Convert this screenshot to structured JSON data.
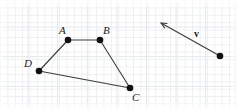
{
  "figure": {
    "width": 237,
    "height": 110,
    "background_color": "#ffffff",
    "grid": {
      "visible": true,
      "minor_color": "#eceff1",
      "major_color": "#e2e6ea",
      "minor_spacing_px": 7.4,
      "major_spacing_px": 29.6
    },
    "stroke_color": "#3b3b3b",
    "point_color": "#111111",
    "label_color": "#1a1a1a"
  },
  "polygon": {
    "name": "ABCD",
    "closed": true,
    "stroke_width": 1.1,
    "vertices": [
      {
        "id": "A",
        "label": "A",
        "x": 68,
        "y": 40,
        "label_x": 59,
        "label_y": 25,
        "radius": 3.3
      },
      {
        "id": "B",
        "label": "B",
        "x": 100,
        "y": 40,
        "label_x": 103,
        "label_y": 25,
        "radius": 3.3
      },
      {
        "id": "C",
        "label": "C",
        "x": 130,
        "y": 88,
        "label_x": 132,
        "label_y": 92,
        "radius": 3.3
      },
      {
        "id": "D",
        "label": "D",
        "x": 39,
        "y": 71,
        "label_x": 24,
        "label_y": 58,
        "radius": 3.3
      }
    ],
    "edges": [
      {
        "from": "A",
        "to": "B"
      },
      {
        "from": "B",
        "to": "C"
      },
      {
        "from": "C",
        "to": "D"
      },
      {
        "from": "D",
        "to": "A"
      }
    ]
  },
  "vector": {
    "label": "v",
    "label_style": "bold",
    "label_x": 194,
    "label_y": 29,
    "tail_x": 220,
    "tail_y": 56,
    "head_x": 161,
    "head_y": 23,
    "tail_dot_radius": 3.3,
    "stroke_width": 1.1,
    "arrowhead": "open-triangle"
  }
}
